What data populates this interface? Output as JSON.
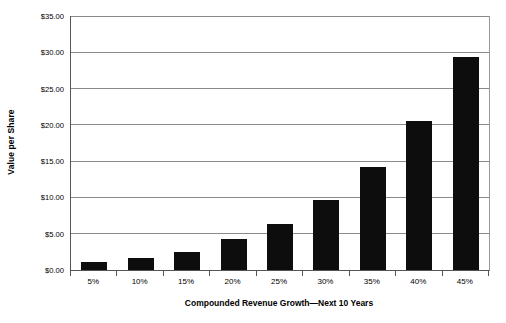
{
  "chart_data": {
    "type": "bar",
    "title": "",
    "xlabel": "Compounded Revenue Growth—Next 10 Years",
    "ylabel": "Value per Share",
    "categories": [
      "5%",
      "10%",
      "15%",
      "20%",
      "25%",
      "30%",
      "35%",
      "40%",
      "45%"
    ],
    "values": [
      1.05,
      1.65,
      2.55,
      4.25,
      6.4,
      9.65,
      14.25,
      20.6,
      29.4
    ],
    "ylim": [
      0,
      35
    ],
    "ytick_values": [
      0,
      5,
      10,
      15,
      20,
      25,
      30,
      35
    ],
    "ytick_labels": [
      "$0.00",
      "$5.00",
      "$10.00",
      "$15.00",
      "$20.00",
      "$25.00",
      "$30.00",
      "$35.00"
    ],
    "grid": true,
    "legend": false,
    "bar_color": "#0d0d0d",
    "gridline_color": "#8a8a8a",
    "axis_color": "#555555",
    "background_color": "#ffffff"
  }
}
